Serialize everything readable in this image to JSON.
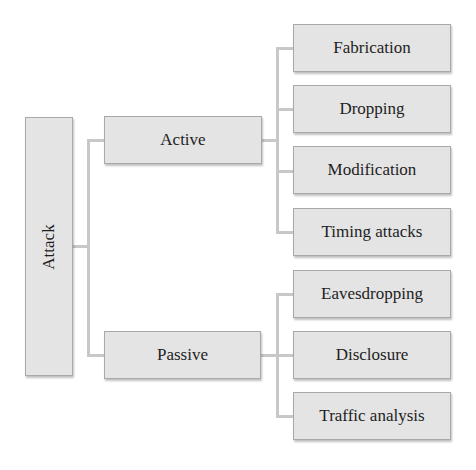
{
  "diagram": {
    "type": "tree",
    "root": {
      "label": "Attack"
    },
    "branches": [
      {
        "label": "Active",
        "children": [
          {
            "label": "Fabrication"
          },
          {
            "label": "Dropping"
          },
          {
            "label": "Modification"
          },
          {
            "label": "Timing attacks"
          }
        ]
      },
      {
        "label": "Passive",
        "children": [
          {
            "label": "Eavesdropping"
          },
          {
            "label": "Disclosure"
          },
          {
            "label": "Traffic analysis"
          }
        ]
      }
    ],
    "colors": {
      "box_fill": "#e4e4e4",
      "box_border": "#a9a9a9",
      "connector": "#c8c8c8",
      "text": "#1e1e1e"
    }
  }
}
